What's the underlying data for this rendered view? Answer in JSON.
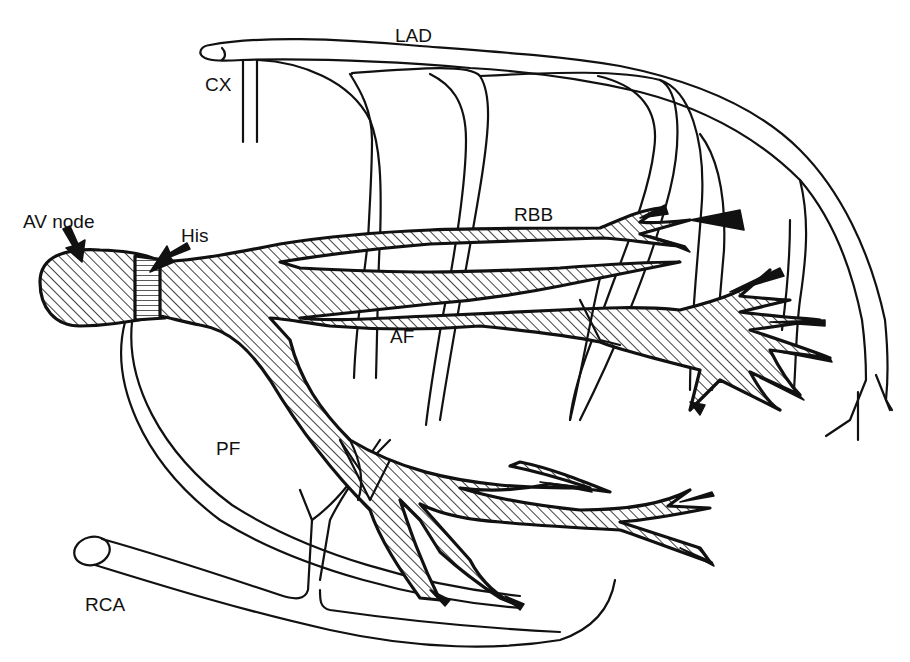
{
  "diagram": {
    "labels": {
      "lad": "LAD",
      "cx": "CX",
      "av_node": "AV node",
      "his": "His",
      "rbb": "RBB",
      "af": "AF",
      "pf": "PF",
      "rca": "RCA"
    },
    "colors": {
      "line": "#111111",
      "background": "#ffffff"
    }
  }
}
